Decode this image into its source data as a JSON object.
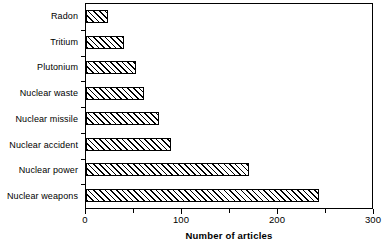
{
  "chart_data": {
    "type": "bar",
    "orientation": "horizontal",
    "title": "",
    "xlabel": "Number of articles",
    "ylabel": "",
    "categories": [
      "Radon",
      "Tritium",
      "Plutonium",
      "Nuclear waste",
      "Nuclear missile",
      "Nuclear accident",
      "Nuclear power",
      "Nuclear weapons"
    ],
    "values": [
      23,
      40,
      52,
      60,
      76,
      89,
      170,
      243
    ],
    "xlim": [
      0,
      300
    ],
    "xticks": [
      0,
      100,
      200,
      300
    ],
    "xtick_labels": [
      "0",
      "100",
      "200",
      "300"
    ],
    "xminor_ticks": [
      50,
      150,
      250
    ],
    "grid": false,
    "legend": null,
    "bar_style": {
      "fill": "#ffffff",
      "hatch": "/",
      "edge_color": "#000000"
    }
  },
  "axis": {
    "x_title": "Number of articles",
    "tick_labels": [
      "0",
      "100",
      "200",
      "300"
    ]
  },
  "series": {
    "bars": [
      {
        "label": "Radon",
        "value": 23
      },
      {
        "label": "Tritium",
        "value": 40
      },
      {
        "label": "Plutonium",
        "value": 52
      },
      {
        "label": "Nuclear waste",
        "value": 60
      },
      {
        "label": "Nuclear missile",
        "value": 76
      },
      {
        "label": "Nuclear accident",
        "value": 89
      },
      {
        "label": "Nuclear power",
        "value": 170
      },
      {
        "label": "Nuclear weapons",
        "value": 243
      }
    ]
  }
}
